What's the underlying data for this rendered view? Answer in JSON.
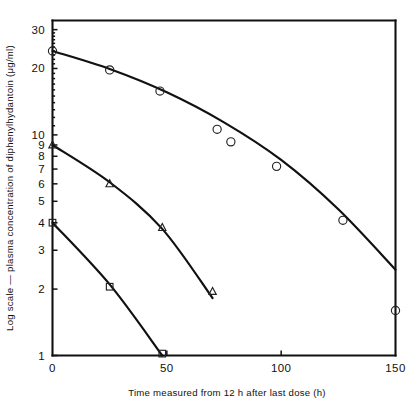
{
  "chart_data": {
    "type": "scatter",
    "title": "",
    "xlabel": "Time measured from 12 h after last dose   (h)",
    "ylabel": "Log scale — plasma concentration of diphenylhydantoin (μg/ml)",
    "yscale": "log",
    "xlim": [
      0,
      150
    ],
    "ylim": [
      1,
      33
    ],
    "grid": false,
    "legend": "none",
    "xticks": [
      0,
      50,
      100,
      150
    ],
    "xticklabels": [
      "0",
      "50",
      "100",
      "150"
    ],
    "yticks": [
      1,
      2,
      3,
      4,
      5,
      6,
      7,
      8,
      9,
      10,
      20,
      30
    ],
    "yticklabels": [
      "1",
      "2",
      "3",
      "4",
      "5",
      "6",
      "7",
      "8",
      "9",
      "10",
      "20",
      "30"
    ],
    "series": [
      {
        "name": "Subject 1 (circles)",
        "marker": "circle",
        "points": [
          {
            "x": 0,
            "y": 24.0
          },
          {
            "x": 25,
            "y": 19.7
          },
          {
            "x": 47,
            "y": 15.8
          },
          {
            "x": 72,
            "y": 10.6
          },
          {
            "x": 78,
            "y": 9.3
          },
          {
            "x": 98,
            "y": 7.2
          },
          {
            "x": 127,
            "y": 4.1
          },
          {
            "x": 150,
            "y": 1.6
          }
        ],
        "fit_curve": [
          {
            "x": 0,
            "y": 24.0
          },
          {
            "x": 25,
            "y": 19.9
          },
          {
            "x": 50,
            "y": 15.6
          },
          {
            "x": 75,
            "y": 11.4
          },
          {
            "x": 100,
            "y": 7.7
          },
          {
            "x": 125,
            "y": 4.6
          },
          {
            "x": 150,
            "y": 2.45
          }
        ]
      },
      {
        "name": "Subject 2 (triangles)",
        "marker": "triangle",
        "points": [
          {
            "x": 0,
            "y": 9.0
          },
          {
            "x": 25,
            "y": 6.0
          },
          {
            "x": 48,
            "y": 3.8
          },
          {
            "x": 70,
            "y": 1.95
          }
        ],
        "fit_curve": [
          {
            "x": 0,
            "y": 9.0
          },
          {
            "x": 25,
            "y": 6.1
          },
          {
            "x": 48,
            "y": 3.75
          },
          {
            "x": 70,
            "y": 1.82
          }
        ]
      },
      {
        "name": "Subject 3 (squares)",
        "marker": "square",
        "points": [
          {
            "x": 0,
            "y": 4.0
          },
          {
            "x": 25,
            "y": 2.05
          },
          {
            "x": 48,
            "y": 1.02
          }
        ],
        "fit_curve": [
          {
            "x": 0,
            "y": 4.0
          },
          {
            "x": 25,
            "y": 2.1
          },
          {
            "x": 48,
            "y": 1.0
          }
        ]
      }
    ]
  },
  "axes": {
    "x_title": "Time measured from 12 h after last dose   (h)",
    "y_title": "Log scale — plasma concentration of diphenylhydantoin (μg/ml)"
  },
  "colors": {
    "ink": "#111111",
    "background": "#ffffff"
  }
}
